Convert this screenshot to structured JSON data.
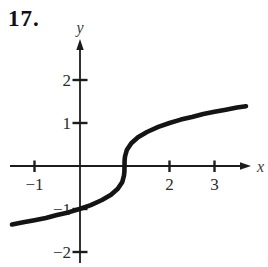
{
  "problem_number": "17.",
  "graph": {
    "x_axis_label": "x",
    "y_axis_label": "y",
    "x_ticks": [
      {
        "value": -1,
        "label": "−1"
      },
      {
        "value": 2,
        "label": "2"
      },
      {
        "value": 3,
        "label": "3"
      }
    ],
    "y_ticks": [
      {
        "value": 2,
        "label": "2"
      },
      {
        "value": 1,
        "label": "1"
      },
      {
        "value": -1,
        "label": "−1"
      },
      {
        "value": -2,
        "label": "−2"
      }
    ]
  },
  "chart_data": {
    "type": "line",
    "title": "",
    "xlabel": "x",
    "ylabel": "y",
    "xlim": [
      -1.55,
      3.75
    ],
    "ylim": [
      -2.3,
      2.9
    ],
    "x_tick_values": [
      -1,
      2,
      3
    ],
    "y_tick_values": [
      -2,
      -1,
      1,
      2
    ],
    "grid": false,
    "legend": false,
    "series": [
      {
        "name": "curve",
        "points": [
          [
            -1.5,
            -1.36
          ],
          [
            -1.25,
            -1.31
          ],
          [
            -1,
            -1.26
          ],
          [
            -0.75,
            -1.21
          ],
          [
            -0.5,
            -1.14
          ],
          [
            -0.25,
            -1.08
          ],
          [
            0,
            -1
          ],
          [
            0.25,
            -0.91
          ],
          [
            0.5,
            -0.79
          ],
          [
            0.7,
            -0.67
          ],
          [
            0.85,
            -0.53
          ],
          [
            0.95,
            -0.37
          ],
          [
            0.99,
            -0.22
          ],
          [
            0.998,
            -0.13
          ],
          [
            1,
            0
          ],
          [
            1.002,
            0.13
          ],
          [
            1.01,
            0.22
          ],
          [
            1.05,
            0.37
          ],
          [
            1.15,
            0.53
          ],
          [
            1.3,
            0.67
          ],
          [
            1.5,
            0.79
          ],
          [
            1.75,
            0.91
          ],
          [
            2,
            1
          ],
          [
            2.25,
            1.08
          ],
          [
            2.5,
            1.14
          ],
          [
            2.75,
            1.21
          ],
          [
            3,
            1.26
          ],
          [
            3.25,
            1.31
          ],
          [
            3.5,
            1.36
          ],
          [
            3.7,
            1.39
          ]
        ]
      }
    ]
  }
}
